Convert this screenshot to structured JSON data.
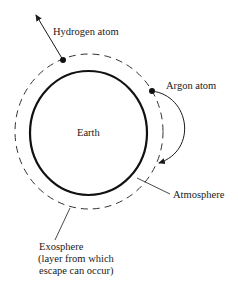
{
  "diagram": {
    "labels": {
      "hydrogen": "Hydrogen atom",
      "argon": "Argon atom",
      "earth": "Earth",
      "atmosphere": "Atmosphere",
      "exosphere_line1": "Exosphere",
      "exosphere_line2": "(layer from which",
      "exosphere_line3": "escape can occur)"
    },
    "colors": {
      "ink": "#1a1a1a",
      "background": "#ffffff"
    }
  }
}
